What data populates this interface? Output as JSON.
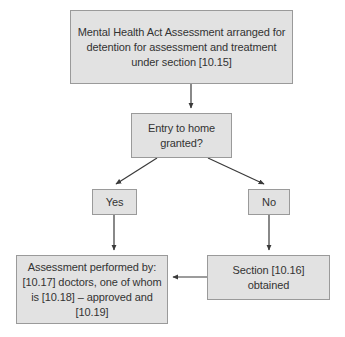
{
  "diagram": {
    "background_color": "#ffffff",
    "node_fill_color": "#e2e2e2",
    "node_border_color": "#9a9a9a",
    "text_color": "#333333",
    "connector_color": "#3a3a3a",
    "nodes": [
      {
        "id": "assessment-arranged",
        "text": "Mental Health Act Assessment arranged for detention for assessment and treatment under section [10.15]"
      },
      {
        "id": "entry-granted",
        "text": "Entry to home granted?"
      },
      {
        "id": "yes",
        "text": "Yes"
      },
      {
        "id": "no",
        "text": "No"
      },
      {
        "id": "assessment-performed",
        "text": "Assessment performed by: [10.17] doctors, one of whom is [10.18] – approved and [10.19]"
      },
      {
        "id": "section-obtained",
        "text": "Section [10.16] obtained"
      }
    ],
    "edges": [
      {
        "id": "arranged-to-entry",
        "from": "assessment-arranged",
        "to": "entry-granted",
        "label": ""
      },
      {
        "id": "entry-to-yes",
        "from": "entry-granted",
        "to": "yes",
        "label": ""
      },
      {
        "id": "entry-to-no",
        "from": "entry-granted",
        "to": "no",
        "label": ""
      },
      {
        "id": "yes-to-performed",
        "from": "yes",
        "to": "assessment-performed",
        "label": ""
      },
      {
        "id": "no-to-section",
        "from": "no",
        "to": "section-obtained",
        "label": ""
      },
      {
        "id": "section-to-performed",
        "from": "section-obtained",
        "to": "assessment-performed",
        "label": ""
      }
    ]
  }
}
